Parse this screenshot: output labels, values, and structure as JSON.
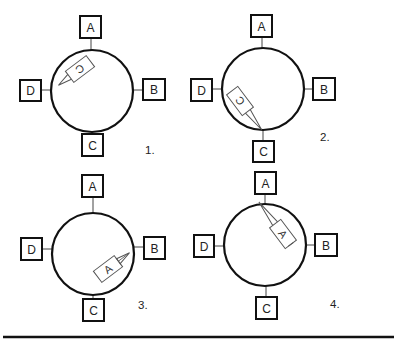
{
  "figure": {
    "colors": {
      "stroke": "#111111",
      "packet_stroke": "#555555",
      "background": "#ffffff"
    },
    "nodes": [
      "A",
      "B",
      "C",
      "D"
    ],
    "panels": [
      {
        "step": "1.",
        "packet_label": "C",
        "packet_note": "packet addressed to C leaving near D side, travelling counter-clockwise"
      },
      {
        "step": "2.",
        "packet_label": "C",
        "packet_note": "packet addressed to C arriving at node C"
      },
      {
        "step": "3.",
        "packet_label": "A",
        "packet_note": "packet addressed to A travelling toward B"
      },
      {
        "step": "4.",
        "packet_label": "A",
        "packet_note": "packet addressed to A arriving at node A"
      }
    ]
  },
  "panel1": {
    "a": "A",
    "b": "B",
    "c": "C",
    "d": "D",
    "packet": "C",
    "step": "1."
  },
  "panel2": {
    "a": "A",
    "b": "B",
    "c": "C",
    "d": "D",
    "packet": "C",
    "step": "2."
  },
  "panel3": {
    "a": "A",
    "b": "B",
    "c": "C",
    "d": "D",
    "packet": "A",
    "step": "3."
  },
  "panel4": {
    "a": "A",
    "b": "B",
    "c": "C",
    "d": "D",
    "packet": "A",
    "step": "4."
  }
}
